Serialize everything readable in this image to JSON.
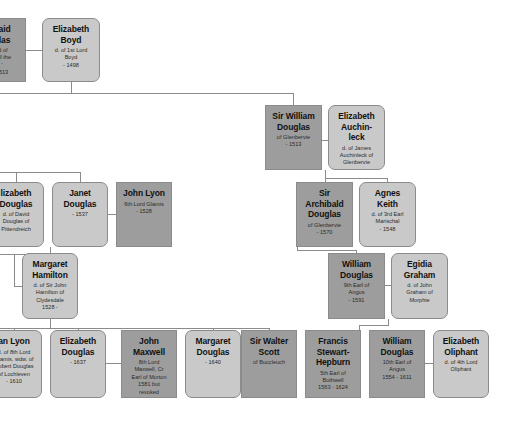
{
  "chart": {
    "colors": {
      "male_fill": "#9d9d9d",
      "female_fill": "#c9c9c9",
      "border": "#8b8b8b",
      "background": "#ffffff",
      "text": "#111111"
    }
  },
  "nodes": [
    {
      "id": "archibald-douglas",
      "name": "baid\nglas",
      "detail": "rd of\nbell the\n'\n1513",
      "sex": "male",
      "x": -22,
      "y": 18,
      "w": 48,
      "h": 64,
      "clipped": true
    },
    {
      "id": "elizabeth-boyd",
      "name": "Elizabeth\nBoyd",
      "detail": "d. of 1st Lord\nBoyd\n- 1498",
      "sex": "female",
      "x": 42,
      "y": 18,
      "w": 58,
      "h": 64
    },
    {
      "id": "sir-william-douglas",
      "name": "Sir William\nDouglas",
      "detail": "of Glenbervie\n- 1513",
      "sex": "male",
      "x": 265,
      "y": 105,
      "w": 57,
      "h": 65
    },
    {
      "id": "elizabeth-auchinleck",
      "name": "Elizabeth\nAuchin-\nleck",
      "detail": "d. of James\nAuchinleck of\nGlenbervie",
      "sex": "female",
      "x": 328,
      "y": 105,
      "w": 57,
      "h": 65
    },
    {
      "id": "elizabeth-douglas-pittendreich",
      "name": "lizabeth\nDouglas",
      "detail": "d. of David\nDouglas of\nPittendreich",
      "sex": "female",
      "x": -12,
      "y": 182,
      "w": 56,
      "h": 65,
      "clipped": true
    },
    {
      "id": "janet-douglas",
      "name": "Janet\nDouglas",
      "detail": "- 1537",
      "sex": "female",
      "x": 52,
      "y": 182,
      "w": 56,
      "h": 65
    },
    {
      "id": "john-lyon",
      "name": "John Lyon",
      "detail": "6th Lord Glamis\n- 1528",
      "sex": "male",
      "x": 116,
      "y": 182,
      "w": 56,
      "h": 65
    },
    {
      "id": "sir-archibald-douglas-glenbervie",
      "name": "Sir\nArchibald\nDouglas",
      "detail": "of Glenbervie\n- 1570",
      "sex": "male",
      "x": 296,
      "y": 182,
      "w": 57,
      "h": 65
    },
    {
      "id": "agnes-keith",
      "name": "Agnes\nKeith",
      "detail": "d. of 3rd Earl\nMarischal\n- 1548",
      "sex": "female",
      "x": 359,
      "y": 182,
      "w": 57,
      "h": 65
    },
    {
      "id": "margaret-hamilton",
      "name": "Margaret\nHamilton",
      "detail": "d. of Sir John\nHamilton of\nClydesdale\n1528 -",
      "sex": "female",
      "x": 22,
      "y": 253,
      "w": 56,
      "h": 66
    },
    {
      "id": "william-douglas-9th",
      "name": "William\nDouglas",
      "detail": "9th Earl of\nAngus\n- 1591",
      "sex": "male",
      "x": 328,
      "y": 253,
      "w": 57,
      "h": 66
    },
    {
      "id": "egidia-graham",
      "name": "Egidia\nGraham",
      "detail": "d. of John\nGraham of\nMorphie",
      "sex": "female",
      "x": 391,
      "y": 253,
      "w": 57,
      "h": 66
    },
    {
      "id": "jean-lyon",
      "name": "an Lyon",
      "detail": "d. of 8th Lord\nGlamis, wdw. of\nRobert Douglas\nof Lochleven\n- 1610",
      "sex": "female",
      "x": -14,
      "y": 330,
      "w": 56,
      "h": 68,
      "clipped": true
    },
    {
      "id": "elizabeth-douglas-1637",
      "name": "Elizabeth\nDouglas",
      "detail": "- 1637",
      "sex": "female",
      "x": 50,
      "y": 330,
      "w": 56,
      "h": 68
    },
    {
      "id": "john-maxwell",
      "name": "John\nMaxwell",
      "detail": "8th Lord\nMaxwell, Cr\nEarl of Morton\n1581 but\nrevoked\n1553 - 1593",
      "sex": "male",
      "x": 121,
      "y": 330,
      "w": 56,
      "h": 68
    },
    {
      "id": "margaret-douglas-1640",
      "name": "Margaret\nDouglas",
      "detail": "- 1640",
      "sex": "female",
      "x": 185,
      "y": 330,
      "w": 56,
      "h": 68
    },
    {
      "id": "sir-walter-scott",
      "name": "Sir Walter\nScott",
      "detail": "of Buccleuch",
      "sex": "male",
      "x": 241,
      "y": 330,
      "w": 56,
      "h": 68
    },
    {
      "id": "francis-stewart-hepburn",
      "name": "Francis\nStewart-\nHepburn",
      "detail": "5th Earl of\nBothwell\n1563 - 1624",
      "sex": "male",
      "x": 305,
      "y": 330,
      "w": 56,
      "h": 68
    },
    {
      "id": "william-douglas-10th",
      "name": "William\nDouglas",
      "detail": "10th Earl of\nAngus\n1554 - 1611",
      "sex": "male",
      "x": 369,
      "y": 330,
      "w": 56,
      "h": 68
    },
    {
      "id": "elizabeth-oliphant",
      "name": "Elizabeth\nOliphant",
      "detail": "d. of 4th Lord\nOliphant",
      "sex": "female",
      "x": 433,
      "y": 330,
      "w": 56,
      "h": 68
    }
  ],
  "connectors": [
    {
      "id": "marriage-archibald-elizabeth-boyd",
      "type": "h",
      "x": 26,
      "y": 50,
      "w": 16,
      "h": 1
    },
    {
      "id": "descent-elizabeth-boyd-stem",
      "type": "v",
      "x": 71,
      "y": 82,
      "w": 1,
      "h": 11
    },
    {
      "id": "sibling-bar-generation2",
      "type": "h",
      "x": 0,
      "y": 93,
      "w": 294,
      "h": 1
    },
    {
      "id": "drop-to-sir-william-douglas",
      "type": "v",
      "x": 293,
      "y": 93,
      "w": 1,
      "h": 12
    },
    {
      "id": "marriage-william-elizabeth-auchinleck",
      "type": "h",
      "x": 322,
      "y": 140,
      "w": 6,
      "h": 1
    },
    {
      "id": "descent-auchinleck-stem",
      "type": "v",
      "x": 325,
      "y": 170,
      "w": 1,
      "h": 8
    },
    {
      "id": "descent-auchinleck-bar",
      "type": "h",
      "x": 325,
      "y": 178,
      "w": 63,
      "h": 1
    },
    {
      "id": "drop-to-sir-archibald",
      "type": "v",
      "x": 325,
      "y": 178,
      "w": 1,
      "h": 4
    },
    {
      "id": "drop-to-agnes-keith",
      "type": "v",
      "x": 387,
      "y": 178,
      "w": 1,
      "h": 4
    },
    {
      "id": "sibling-bar-generation3-left",
      "type": "h",
      "x": 0,
      "y": 172,
      "w": 81,
      "h": 1
    },
    {
      "id": "drop-to-elizabeth-douglas-pitt",
      "type": "v",
      "x": 16,
      "y": 172,
      "w": 1,
      "h": 10
    },
    {
      "id": "drop-to-janet-douglas",
      "type": "v",
      "x": 80,
      "y": 172,
      "w": 1,
      "h": 10
    },
    {
      "id": "marriage-janet-john-lyon",
      "type": "h",
      "x": 108,
      "y": 214,
      "w": 8,
      "h": 1
    },
    {
      "id": "descent-janet-stem",
      "type": "v",
      "x": 50,
      "y": 247,
      "w": 1,
      "h": 7
    },
    {
      "id": "descent-janet-bar",
      "type": "h",
      "x": 0,
      "y": 254,
      "w": 51,
      "h": 1
    },
    {
      "id": "marriage-margaret-hamilton-left",
      "type": "h",
      "x": 14,
      "y": 286,
      "w": 8,
      "h": 1
    },
    {
      "id": "marriage-archibald-margaret-stem",
      "type": "v",
      "x": 14,
      "y": 254,
      "w": 1,
      "h": 33
    },
    {
      "id": "descent-margaret-hamilton-stem",
      "type": "v",
      "x": 50,
      "y": 319,
      "w": 1,
      "h": 9
    },
    {
      "id": "sibling-bar-generation4",
      "type": "h",
      "x": 0,
      "y": 328,
      "w": 270,
      "h": 1
    },
    {
      "id": "drop-to-jean-lyon",
      "type": "v",
      "x": 14,
      "y": 328,
      "w": 1,
      "h": 3
    },
    {
      "id": "drop-to-elizabeth-douglas-1637",
      "type": "v",
      "x": 78,
      "y": 328,
      "w": 1,
      "h": 3
    },
    {
      "id": "drop-to-margaret-douglas",
      "type": "v",
      "x": 213,
      "y": 328,
      "w": 1,
      "h": 3
    },
    {
      "id": "drop-to-francis-stewart",
      "type": "v",
      "x": 269,
      "y": 328,
      "w": 1,
      "h": 3
    },
    {
      "id": "marriage-elizabeth-john-maxwell",
      "type": "h",
      "x": 106,
      "y": 363,
      "w": 15,
      "h": 1
    },
    {
      "id": "marriage-margaret-walter-scott",
      "type": "h",
      "x": 241,
      "y": 363,
      "w": 0,
      "h": 1
    },
    {
      "id": "marriage-margaret-scott-link",
      "type": "h",
      "x": 236,
      "y": 363,
      "w": 6,
      "h": 1
    },
    {
      "id": "marriage-9th-earl-egidia",
      "type": "h",
      "x": 385,
      "y": 285,
      "w": 6,
      "h": 1
    },
    {
      "id": "descent-egidia-stem",
      "type": "v",
      "x": 388,
      "y": 319,
      "w": 1,
      "h": 6
    },
    {
      "id": "descent-egidia-bar",
      "type": "h",
      "x": 359,
      "y": 325,
      "w": 30,
      "h": 1
    },
    {
      "id": "drop-to-william-douglas-10th",
      "type": "v",
      "x": 359,
      "y": 325,
      "w": 1,
      "h": 6
    },
    {
      "id": "marriage-10th-earl-oliphant",
      "type": "h",
      "x": 425,
      "y": 363,
      "w": 8,
      "h": 1
    },
    {
      "id": "sibling-bar-9th-earl",
      "type": "h",
      "x": 297,
      "y": 250,
      "w": 60,
      "h": 1
    },
    {
      "id": "drop-to-9th-earl",
      "type": "v",
      "x": 356,
      "y": 250,
      "w": 1,
      "h": 4
    },
    {
      "id": "riser-from-archibald-glenbervie",
      "type": "v",
      "x": 297,
      "y": 247,
      "w": 1,
      "h": 4
    }
  ]
}
